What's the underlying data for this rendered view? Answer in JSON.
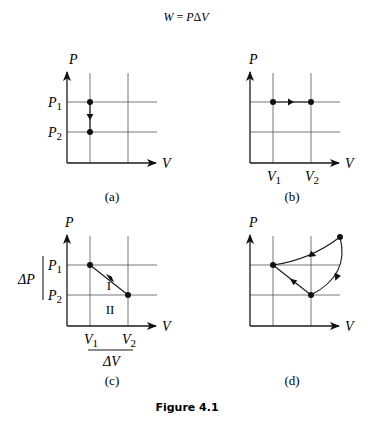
{
  "equation": {
    "lhs": "W",
    "eq": " = ",
    "rhs_p": "P",
    "rhs_delta": "Δ",
    "rhs_v": "V"
  },
  "panels": {
    "a": {
      "caption": "(a)",
      "y_axis_label": "P",
      "x_axis_label": "V",
      "p1_label": "P",
      "p1_sub": "1",
      "p2_label": "P",
      "p2_sub": "2",
      "process": "isochoric: pressure decreases from P1 to P2 at constant volume"
    },
    "b": {
      "caption": "(b)",
      "y_axis_label": "P",
      "x_axis_label": "V",
      "v1_label": "V",
      "v1_sub": "1",
      "v2_label": "V",
      "v2_sub": "2",
      "process": "isobaric: volume increases from V1 to V2 at constant pressure"
    },
    "c": {
      "caption": "(c)",
      "y_axis_label": "P",
      "x_axis_label": "V",
      "p1_label": "P",
      "p1_sub": "1",
      "p2_label": "P",
      "p2_sub": "2",
      "v1_label": "V",
      "v1_sub": "1",
      "v2_label": "V",
      "v2_sub": "2",
      "delta_p": "ΔP",
      "delta_v": "ΔV",
      "region_1": "I",
      "region_2": "II",
      "process": "straight line from (V1,P1) to (V2,P2)"
    },
    "d": {
      "caption": "(d)",
      "y_axis_label": "P",
      "x_axis_label": "V",
      "process": "closed cycle through three points with curved and straight segments"
    }
  },
  "figure_caption": "Figure 4.1"
}
